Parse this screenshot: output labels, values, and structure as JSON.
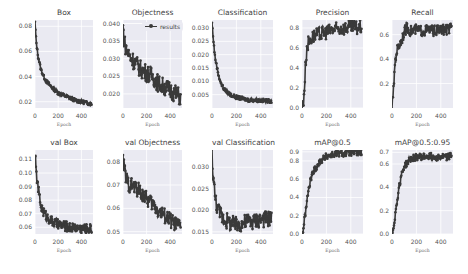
{
  "chart_data": [
    {
      "type": "line",
      "title": "Box",
      "xlabel": "Epoch",
      "ylabel": "",
      "xlim": [
        0,
        500
      ],
      "ylim": [
        0.015,
        0.085
      ],
      "xticks": [
        "0",
        "200",
        "400"
      ],
      "yticks": [
        "0.02",
        "0.04",
        "0.06",
        "0.08"
      ],
      "grid": true,
      "series": [
        {
          "name": "results",
          "x": [
            0,
            10,
            25,
            50,
            75,
            100,
            150,
            200,
            250,
            300,
            350,
            400,
            450,
            490
          ],
          "values": [
            0.083,
            0.068,
            0.057,
            0.046,
            0.04,
            0.036,
            0.031,
            0.027,
            0.025,
            0.023,
            0.021,
            0.02,
            0.019,
            0.018
          ]
        }
      ]
    },
    {
      "type": "line",
      "title": "Objectness",
      "xlabel": "Epoch",
      "ylabel": "",
      "xlim": [
        0,
        500
      ],
      "ylim": [
        0.016,
        0.041
      ],
      "xticks": [
        "0",
        "200",
        "400"
      ],
      "yticks": [
        "0.020",
        "0.025",
        "0.030",
        "0.035",
        "0.040"
      ],
      "grid": true,
      "legend": [
        "results"
      ],
      "legend_position": "upper right",
      "series": [
        {
          "name": "results",
          "x": [
            0,
            10,
            25,
            50,
            75,
            100,
            150,
            200,
            250,
            300,
            350,
            400,
            450,
            490
          ],
          "values": [
            0.039,
            0.035,
            0.033,
            0.031,
            0.03,
            0.029,
            0.027,
            0.026,
            0.025,
            0.023,
            0.022,
            0.021,
            0.02,
            0.019
          ]
        }
      ]
    },
    {
      "type": "line",
      "title": "Classification",
      "xlabel": "Epoch",
      "ylabel": "",
      "xlim": [
        0,
        500
      ],
      "ylim": [
        0.0,
        0.033
      ],
      "xticks": [
        "0",
        "200",
        "400"
      ],
      "yticks": [
        "0.005",
        "0.010",
        "0.015",
        "0.020",
        "0.025",
        "0.030"
      ],
      "grid": true,
      "series": [
        {
          "name": "results",
          "x": [
            0,
            10,
            25,
            50,
            75,
            100,
            150,
            200,
            250,
            300,
            350,
            400,
            450,
            490
          ],
          "values": [
            0.032,
            0.026,
            0.019,
            0.013,
            0.009,
            0.007,
            0.005,
            0.004,
            0.0035,
            0.003,
            0.003,
            0.0028,
            0.0027,
            0.0026
          ]
        }
      ]
    },
    {
      "type": "line",
      "title": "Precision",
      "xlabel": "Epoch",
      "ylabel": "",
      "xlim": [
        0,
        500
      ],
      "ylim": [
        0.0,
        0.88
      ],
      "xticks": [
        "0",
        "200",
        "400"
      ],
      "yticks": [
        "0.0",
        "0.2",
        "0.4",
        "0.6",
        "0.8"
      ],
      "grid": true,
      "series": [
        {
          "name": "results",
          "x": [
            0,
            10,
            20,
            30,
            40,
            50,
            75,
            100,
            150,
            200,
            250,
            300,
            350,
            400,
            450,
            490
          ],
          "values": [
            0.0,
            0.05,
            0.2,
            0.45,
            0.6,
            0.65,
            0.7,
            0.72,
            0.74,
            0.76,
            0.78,
            0.79,
            0.8,
            0.81,
            0.8,
            0.81
          ]
        }
      ]
    },
    {
      "type": "line",
      "title": "Recall",
      "xlabel": "Epoch",
      "ylabel": "",
      "xlim": [
        0,
        500
      ],
      "ylim": [
        0.0,
        0.72
      ],
      "xticks": [
        "0",
        "200",
        "400"
      ],
      "yticks": [
        "0.2",
        "0.4",
        "0.6"
      ],
      "grid": true,
      "series": [
        {
          "name": "results",
          "x": [
            0,
            10,
            20,
            30,
            40,
            50,
            75,
            100,
            125,
            150,
            200,
            250,
            300,
            350,
            400,
            450,
            490
          ],
          "values": [
            0.02,
            0.1,
            0.3,
            0.42,
            0.47,
            0.5,
            0.55,
            0.62,
            0.66,
            0.63,
            0.64,
            0.63,
            0.64,
            0.63,
            0.64,
            0.64,
            0.65
          ]
        }
      ]
    },
    {
      "type": "line",
      "title": "val Box",
      "xlabel": "Epoch",
      "ylabel": "",
      "xlim": [
        0,
        500
      ],
      "ylim": [
        0.055,
        0.117
      ],
      "xticks": [
        "0",
        "200",
        "400"
      ],
      "yticks": [
        "0.06",
        "0.07",
        "0.08",
        "0.09",
        "0.10",
        "0.11"
      ],
      "grid": true,
      "series": [
        {
          "name": "results",
          "x": [
            0,
            10,
            25,
            50,
            75,
            100,
            150,
            200,
            250,
            300,
            350,
            400,
            450,
            490
          ],
          "values": [
            0.115,
            0.1,
            0.09,
            0.076,
            0.071,
            0.068,
            0.064,
            0.062,
            0.061,
            0.06,
            0.06,
            0.059,
            0.059,
            0.059
          ]
        }
      ]
    },
    {
      "type": "line",
      "title": "val Objectness",
      "xlabel": "Epoch",
      "ylabel": "",
      "xlim": [
        0,
        500
      ],
      "ylim": [
        0.049,
        0.085
      ],
      "xticks": [
        "0",
        "200",
        "400"
      ],
      "yticks": [
        "0.05",
        "0.06",
        "0.07",
        "0.08"
      ],
      "grid": true,
      "series": [
        {
          "name": "results",
          "x": [
            0,
            10,
            25,
            50,
            75,
            100,
            150,
            200,
            250,
            300,
            350,
            400,
            450,
            490
          ],
          "values": [
            0.08,
            0.078,
            0.073,
            0.07,
            0.07,
            0.069,
            0.067,
            0.064,
            0.062,
            0.059,
            0.057,
            0.055,
            0.053,
            0.052
          ]
        }
      ]
    },
    {
      "type": "line",
      "title": "val Classification",
      "xlabel": "Epoch",
      "ylabel": "",
      "xlim": [
        0,
        500
      ],
      "ylim": [
        0.0145,
        0.034
      ],
      "xticks": [
        "0",
        "200",
        "400"
      ],
      "yticks": [
        "0.015",
        "0.020",
        "0.025",
        "0.030"
      ],
      "grid": true,
      "series": [
        {
          "name": "results",
          "x": [
            0,
            10,
            25,
            50,
            75,
            100,
            150,
            200,
            250,
            300,
            350,
            400,
            450,
            490
          ],
          "values": [
            0.033,
            0.028,
            0.023,
            0.02,
            0.019,
            0.018,
            0.017,
            0.0165,
            0.017,
            0.0175,
            0.0175,
            0.018,
            0.018,
            0.0182
          ]
        }
      ]
    },
    {
      "type": "line",
      "title": "mAP@0.5",
      "xlabel": "Epoch",
      "ylabel": "",
      "xlim": [
        0,
        500
      ],
      "ylim": [
        0.0,
        0.92
      ],
      "xticks": [
        "0",
        "200",
        "400"
      ],
      "yticks": [
        "0.0",
        "0.2",
        "0.4",
        "0.6",
        "0.8",
        "0.9"
      ],
      "grid": true,
      "series": [
        {
          "name": "results",
          "x": [
            0,
            10,
            25,
            50,
            75,
            100,
            150,
            200,
            250,
            300,
            350,
            400,
            450,
            490
          ],
          "values": [
            0.0,
            0.05,
            0.2,
            0.45,
            0.62,
            0.7,
            0.8,
            0.85,
            0.87,
            0.88,
            0.88,
            0.89,
            0.89,
            0.89
          ]
        }
      ]
    },
    {
      "type": "line",
      "title": "mAP@0.5:0.95",
      "xlabel": "Epoch",
      "ylabel": "",
      "xlim": [
        0,
        500
      ],
      "ylim": [
        0.0,
        0.72
      ],
      "xticks": [
        "0",
        "200",
        "400"
      ],
      "yticks": [
        "0.0",
        "0.2",
        "0.4",
        "0.6",
        "0.7"
      ],
      "grid": true,
      "series": [
        {
          "name": "results",
          "x": [
            0,
            10,
            25,
            50,
            75,
            100,
            150,
            200,
            250,
            300,
            350,
            400,
            450,
            490
          ],
          "values": [
            0.0,
            0.05,
            0.15,
            0.35,
            0.5,
            0.58,
            0.64,
            0.66,
            0.66,
            0.67,
            0.66,
            0.66,
            0.66,
            0.67
          ]
        }
      ]
    }
  ],
  "panels": [
    {
      "title": "Box",
      "xlabel": "Epoch"
    },
    {
      "title": "Objectness",
      "xlabel": "Epoch",
      "legend": "results"
    },
    {
      "title": "Classification",
      "xlabel": "Epoch"
    },
    {
      "title": "Precision",
      "xlabel": "Epoch"
    },
    {
      "title": "Recall",
      "xlabel": "Epoch"
    },
    {
      "title": "val Box",
      "xlabel": "Epoch"
    },
    {
      "title": "val Objectness",
      "xlabel": "Epoch"
    },
    {
      "title": "val Classification",
      "xlabel": "Epoch"
    },
    {
      "title": "mAP@0.5",
      "xlabel": "Epoch"
    },
    {
      "title": "mAP@0.5:0.95",
      "xlabel": "Epoch"
    }
  ],
  "colors": {
    "plot_bg": "#eaeaf2",
    "line": "#3a3a3a",
    "grid": "#ffffff"
  }
}
